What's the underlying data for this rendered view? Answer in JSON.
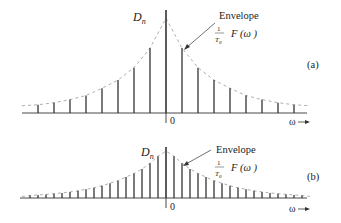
{
  "panels": [
    {
      "id": "a",
      "label": "(a)",
      "ylabel": "D",
      "ylabel_sub": "n",
      "origin_label": "0",
      "axis_label": "ω",
      "envelope_label": "Envelope",
      "envelope_frac_num": "1",
      "envelope_frac_den": "T",
      "envelope_frac_den_sub": "0",
      "envelope_func": "F (ω )",
      "axis_y": 113,
      "top_y": 10,
      "center_x": 166,
      "spacing": 16,
      "axis_x0": 22,
      "axis_x1": 307,
      "heights_one_side": [
        1.0,
        0.63,
        0.44,
        0.32,
        0.24,
        0.17,
        0.13,
        0.1,
        0.08
      ]
    },
    {
      "id": "b",
      "label": "(b)",
      "ylabel": "D",
      "ylabel_sub": "n",
      "origin_label": "0",
      "axis_label": "ω",
      "envelope_label": "Envelope",
      "envelope_frac_num": "1",
      "envelope_frac_den": "T",
      "envelope_frac_den_sub": "0",
      "envelope_func": "F (ω )",
      "axis_y": 198,
      "top_y": 147,
      "center_x": 166,
      "spacing": 8,
      "axis_x0": 20,
      "axis_x1": 307,
      "heights_one_side": [
        1.0,
        0.82,
        0.68,
        0.57,
        0.48,
        0.41,
        0.34,
        0.29,
        0.24,
        0.2,
        0.17,
        0.14,
        0.12,
        0.1,
        0.085,
        0.07,
        0.06,
        0.05
      ]
    }
  ],
  "colors": {
    "stem": "#333333",
    "envelope": "#999999",
    "axis": "#333333"
  }
}
